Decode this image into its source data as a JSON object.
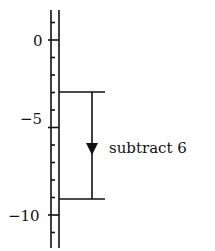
{
  "diagram": {
    "type": "number-line-vertical",
    "axis": {
      "min": -12,
      "max": 2,
      "tick_step": 1,
      "labels": [
        {
          "value": 0,
          "text": "0"
        },
        {
          "value": -5,
          "text": "−5"
        },
        {
          "value": -10,
          "text": "−10"
        }
      ]
    },
    "bracket": {
      "from": -3,
      "to": -9,
      "direction": "down",
      "label": "subtract 6"
    },
    "colors": {
      "ink": "#111111",
      "background": "#ffffff"
    }
  }
}
